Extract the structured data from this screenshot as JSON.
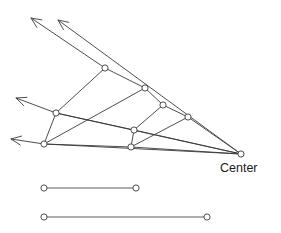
{
  "figure": {
    "title": "",
    "labels": [
      {
        "id": "center-label",
        "text": "Center",
        "x": 220,
        "y": 172
      }
    ],
    "colors": {
      "stroke": "#3a3a3a",
      "node_fill": "#ffffff",
      "background": "#ffffff",
      "text": "#1a1a1a",
      "segment_stroke": "#4a4a4a"
    },
    "center_node": {
      "id": "center",
      "x": 241,
      "y": 154,
      "r": 3.1
    },
    "nodes": [
      {
        "id": "n-top",
        "x": 105,
        "y": 68,
        "r": 3.1
      },
      {
        "id": "n-upper-mid",
        "x": 145,
        "y": 88,
        "r": 3.1
      },
      {
        "id": "n-mid-right",
        "x": 163,
        "y": 105,
        "r": 3.1
      },
      {
        "id": "n-right",
        "x": 188,
        "y": 117,
        "r": 3.1
      },
      {
        "id": "n-left-upper",
        "x": 56,
        "y": 113,
        "r": 3.1
      },
      {
        "id": "n-left-lower",
        "x": 44,
        "y": 144,
        "r": 3.1
      },
      {
        "id": "n-inner",
        "x": 134,
        "y": 130,
        "r": 3.1
      },
      {
        "id": "n-bottom-mid",
        "x": 131,
        "y": 147,
        "r": 3.1
      }
    ],
    "edges": [
      {
        "id": "e-top-leftupper",
        "from": "n-top",
        "to": "n-left-upper"
      },
      {
        "id": "e-top-uppermid",
        "from": "n-top",
        "to": "n-upper-mid"
      },
      {
        "id": "e-uppermid-midright",
        "from": "n-upper-mid",
        "to": "n-mid-right"
      },
      {
        "id": "e-midright-right",
        "from": "n-mid-right",
        "to": "n-right"
      },
      {
        "id": "e-right-center",
        "from": "n-right",
        "to": "center"
      },
      {
        "id": "e-leftupper-leftlower",
        "from": "n-left-upper",
        "to": "n-left-lower"
      },
      {
        "id": "e-leftupper-center",
        "from": "n-left-upper",
        "to": "center"
      },
      {
        "id": "e-leftlower-center",
        "from": "n-left-lower",
        "to": "center"
      },
      {
        "id": "e-leftlower-uppermid",
        "from": "n-left-lower",
        "to": "n-upper-mid"
      },
      {
        "id": "e-leftupper-inner",
        "from": "n-left-upper",
        "to": "n-inner"
      },
      {
        "id": "e-inner-midright",
        "from": "n-inner",
        "to": "n-mid-right"
      },
      {
        "id": "e-inner-bottommid",
        "from": "n-inner",
        "to": "n-bottom-mid"
      },
      {
        "id": "e-inner-center",
        "from": "n-inner",
        "to": "center"
      },
      {
        "id": "e-bottommid-center",
        "from": "n-bottom-mid",
        "to": "center"
      },
      {
        "id": "e-leftlower-bottommid",
        "from": "n-left-lower",
        "to": "n-bottom-mid"
      },
      {
        "id": "e-bottommid-right",
        "from": "n-bottom-mid",
        "to": "n-right"
      }
    ],
    "rays": [
      {
        "id": "ray-top-outer",
        "from_x": 105,
        "from_y": 68,
        "tip_x": 31,
        "tip_y": 18,
        "direction": "upper-left"
      },
      {
        "id": "ray-top-inner",
        "from_x": 241,
        "from_y": 154,
        "tip_x": 58,
        "tip_y": 20,
        "direction": "upper-left"
      },
      {
        "id": "ray-left-upper",
        "from_x": 56,
        "from_y": 113,
        "tip_x": 16,
        "tip_y": 98,
        "direction": "left"
      },
      {
        "id": "ray-left-lower",
        "from_x": 44,
        "from_y": 144,
        "tip_x": 11,
        "tip_y": 139,
        "direction": "left"
      }
    ],
    "segments": [
      {
        "id": "segment-short",
        "y": 188,
        "x1": 44,
        "x2": 136,
        "r": 3.1,
        "endpoints": [
          {
            "x": 44,
            "y": 188
          },
          {
            "x": 136,
            "y": 188
          }
        ]
      },
      {
        "id": "segment-long",
        "y": 217,
        "x1": 44,
        "x2": 207,
        "r": 3.1,
        "endpoints": [
          {
            "x": 44,
            "y": 217
          },
          {
            "x": 207,
            "y": 217
          }
        ]
      }
    ]
  }
}
